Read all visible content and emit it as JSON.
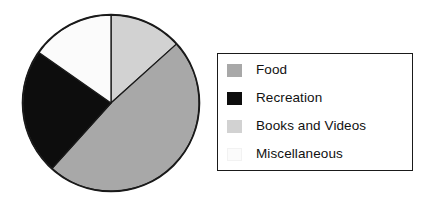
{
  "figure": {
    "type": "pie-chart-with-legend",
    "background_color": "#ffffff"
  },
  "legend": {
    "border_color": "#1a1a1a",
    "background_color": "#ffffff",
    "items": [
      {
        "label": "Food",
        "color": "#a8a8a8"
      },
      {
        "label": "Recreation",
        "color": "#0d0d0d"
      },
      {
        "label": "Books and Videos",
        "color": "#d2d2d2"
      },
      {
        "label": "Miscellaneous",
        "color": "#fbfbfb"
      }
    ]
  },
  "chart_data": {
    "type": "pie",
    "title": "",
    "labels": [
      "Food",
      "Recreation",
      "Books and Videos",
      "Miscellaneous"
    ],
    "values": [
      48,
      23,
      14,
      15
    ],
    "colors": [
      "#a8a8a8",
      "#0d0d0d",
      "#d2d2d2",
      "#fbfbfb"
    ],
    "start_angle_deg": 0,
    "direction": "clockwise",
    "slice_order_clockwise_from_12": [
      "Books and Videos",
      "Food",
      "Recreation",
      "Miscellaneous"
    ],
    "slice_angles_deg": {
      "Books and Videos": [
        0,
        48
      ],
      "Food": [
        48,
        222
      ],
      "Recreation": [
        222,
        305
      ],
      "Miscellaneous": [
        305,
        360
      ]
    },
    "outline_color": "#1a1a1a",
    "legend_position": "right",
    "grid": false,
    "xlabel": "",
    "ylabel": ""
  }
}
